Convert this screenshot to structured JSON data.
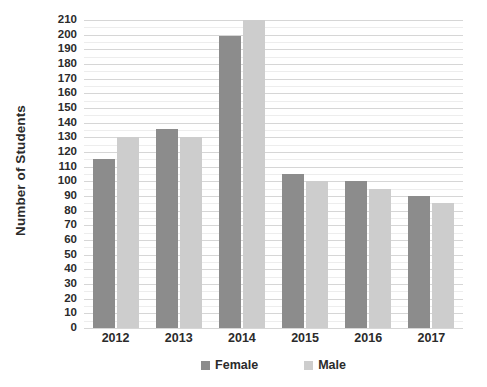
{
  "chart_data": {
    "type": "bar",
    "title": "",
    "xlabel": "",
    "ylabel": "Number of Students",
    "categories": [
      "2012",
      "2013",
      "2014",
      "2015",
      "2016",
      "2017"
    ],
    "series": [
      {
        "name": "Female",
        "color": "#8c8c8c",
        "values": [
          115,
          136,
          199,
          105,
          100,
          90
        ]
      },
      {
        "name": "Male",
        "color": "#cdcdcd",
        "values": [
          130,
          130,
          210,
          100,
          95,
          85
        ]
      }
    ],
    "ylim": [
      0,
      210
    ],
    "ytick_step": 10,
    "yticks": [
      0,
      10,
      20,
      30,
      40,
      50,
      60,
      70,
      80,
      90,
      100,
      110,
      120,
      130,
      140,
      150,
      160,
      170,
      180,
      190,
      200,
      210
    ],
    "ytick_labels": [
      "0",
      "10",
      "20",
      "30",
      "40",
      "50",
      "60",
      "70",
      "80",
      "90",
      "100",
      "110",
      "120",
      "130",
      "140",
      "150",
      "160",
      "170",
      "180",
      "190",
      "200",
      "210"
    ],
    "grid": true,
    "minor_grid": true,
    "legend_position": "bottom",
    "legend_entries": [
      "Female",
      "Male"
    ]
  }
}
